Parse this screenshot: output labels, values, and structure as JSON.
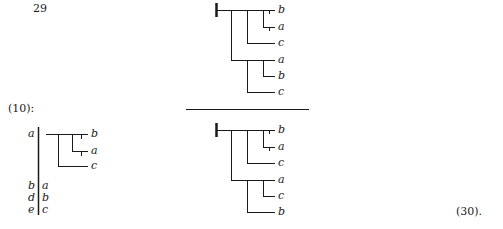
{
  "page_number": "29",
  "equation_ref_left": "(10):",
  "equation_number": "(30).",
  "left_tree": {
    "stem_label_top": "a",
    "tree_leaves": [
      "b",
      "a",
      "c"
    ],
    "pairs": [
      {
        "left": "b",
        "right": "a"
      },
      {
        "left": "d",
        "right": "b"
      },
      {
        "left": "e",
        "right": "c"
      }
    ]
  },
  "numerator_tree": {
    "leaves": [
      "b",
      "a",
      "c",
      "a",
      "b",
      "c"
    ]
  },
  "denominator_tree": {
    "leaves": [
      "b",
      "a",
      "c",
      "a",
      "c",
      "b"
    ]
  },
  "colors": {
    "ink": "#1a1a1a",
    "background": "#ffffff"
  }
}
